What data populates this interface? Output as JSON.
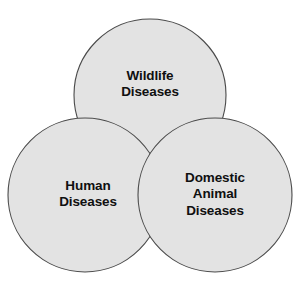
{
  "diagram": {
    "type": "venn-3-circle",
    "background_color": "#ffffff",
    "fill_color": "#e3e3e3",
    "stroke_color": "#4a4a4a",
    "text_color": "#101010",
    "sets": [
      {
        "id": "wildlife",
        "label": "Wildlife\nDiseases",
        "label_line_1": "Wildlife",
        "label_line_2": "Diseases",
        "cx": 150,
        "cy": 95,
        "r": 76,
        "position": "top"
      },
      {
        "id": "human",
        "label": "Human\nDiseases",
        "label_line_1": "Human",
        "label_line_2": "Diseases",
        "cx": 85,
        "cy": 195,
        "r": 77,
        "position": "bottom-left"
      },
      {
        "id": "domestic-animal",
        "label": "Domestic\nAnimal\nDiseases",
        "label_line_1": "Domestic",
        "label_line_2": "Animal",
        "label_line_3": "Diseases",
        "cx": 215,
        "cy": 195,
        "r": 77,
        "position": "bottom-right"
      }
    ]
  }
}
